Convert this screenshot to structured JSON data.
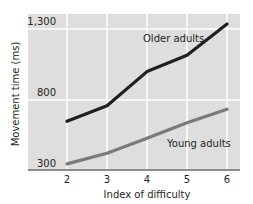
{
  "chart_data": {
    "type": "line",
    "title": "",
    "xlabel": "Index of difficulty",
    "ylabel": "Movement time (ms)",
    "x": [
      2,
      3,
      4,
      5,
      6
    ],
    "x_ticks": [
      "2",
      "3",
      "4",
      "5",
      "6"
    ],
    "y_ticks": [
      "300",
      "800",
      "1,300"
    ],
    "y_tick_values": [
      300,
      800,
      1300
    ],
    "ylim": [
      300,
      1350
    ],
    "xlim": [
      1.0,
      6.3
    ],
    "grid": true,
    "series": [
      {
        "name": "Older adults",
        "values": [
          650,
          760,
          1000,
          1115,
          1335
        ],
        "color": "#231f20",
        "label_position": {
          "x": 3.9,
          "y": 1210
        }
      },
      {
        "name": "Young adults",
        "values": [
          350,
          425,
          530,
          640,
          735
        ],
        "color": "#7a7a7a",
        "label_position": {
          "x": 4.5,
          "y": 470
        }
      }
    ],
    "legend": "inline labels"
  },
  "colors": {
    "plot_background": "#dedede",
    "gridline": "#ffffff",
    "axis": "#8c8c8c",
    "text": "#231f20"
  }
}
